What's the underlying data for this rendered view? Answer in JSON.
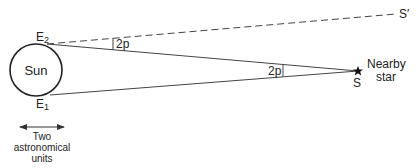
{
  "diagram": {
    "sun": {
      "label": "Sun"
    },
    "earth_positions": {
      "e1": {
        "label": "E",
        "subscript": "1"
      },
      "e2": {
        "label": "E",
        "subscript": "2"
      }
    },
    "star": {
      "point_label": "S",
      "name_line1": "Nearby",
      "name_line2": "star"
    },
    "distant_direction": {
      "label": "S′"
    },
    "angles": {
      "near_earth": {
        "label": "2p"
      },
      "near_star": {
        "label": "2p"
      }
    },
    "scale_bar": {
      "line1": "Two",
      "line2": "astronomical",
      "line3": "units"
    },
    "colors": {
      "line": "#333333",
      "text": "#222222",
      "background": "#ffffff"
    }
  }
}
